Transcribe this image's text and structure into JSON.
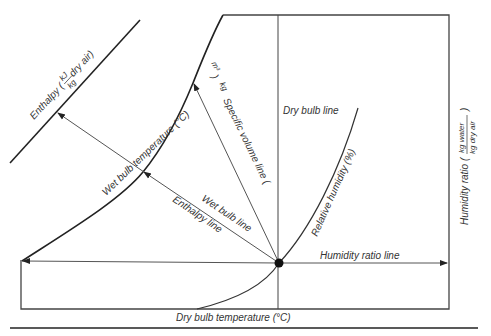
{
  "labels": {
    "enthalpy_axis": "Enthalpy (",
    "enthalpy_unit_num": "kJ",
    "enthalpy_unit_den": "kg",
    "enthalpy_unit_suffix": " dry air)",
    "wet_bulb_temperature": "Wet bulb temperature (°C)",
    "specific_volume_line": "Specific volume line (",
    "specific_volume_unit_num": "m³",
    "specific_volume_unit_den": "kg",
    "specific_volume_close": ")",
    "dry_bulb_line": "Dry bulb line",
    "relative_humidity": "Relative humidity (%)",
    "wet_bulb_line": "Wet bulb line",
    "enthalpy_line": "Enthalpy line",
    "humidity_ratio_line": "Humidity ratio line",
    "humidity_ratio_axis": "Humidity ratio (",
    "humidity_ratio_unit_num": "kg water",
    "humidity_ratio_unit_den": "kg dry air",
    "humidity_ratio_close": ")",
    "dry_bulb_temperature": "Dry bulb temperature (°C)"
  },
  "colors": {
    "line": "#333333",
    "thin_line": "#555555",
    "state_point": "#111111"
  }
}
